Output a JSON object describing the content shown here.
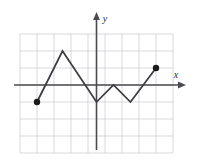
{
  "figure": {
    "title": "",
    "axis_labels": {
      "x": "x",
      "y": "y"
    },
    "colors": {
      "grid": "#cfcfd4",
      "axis": "#4a4a4f",
      "curve": "#3a3a40",
      "point": "#1a1a1a",
      "background": "#ffffff"
    }
  },
  "chart_data": {
    "type": "line",
    "title": "",
    "xlabel": "x",
    "ylabel": "y",
    "xlim": [
      -4.5,
      4.5
    ],
    "ylim": [
      -4,
      3
    ],
    "grid": true,
    "legend": "none",
    "x_ticks": [
      -4,
      -3,
      -2,
      -1,
      0,
      1,
      2,
      3,
      4
    ],
    "y_ticks": [
      -4,
      -3,
      -2,
      -1,
      0,
      1,
      2,
      3
    ],
    "series": [
      {
        "name": "piecewise-linear-zigzag",
        "x": [
          -3.5,
          -2,
          0,
          1,
          2,
          3.5
        ],
        "y": [
          -1,
          2,
          -1,
          0,
          -1,
          1
        ]
      }
    ],
    "annotations": [
      {
        "type": "closed-point",
        "x": -3.5,
        "y": -1,
        "label": ""
      },
      {
        "type": "closed-point",
        "x": 3.5,
        "y": 1,
        "label": ""
      }
    ]
  }
}
